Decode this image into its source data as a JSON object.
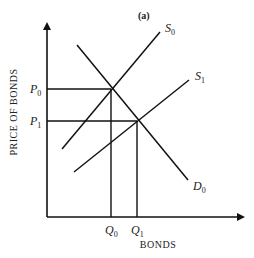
{
  "panel_label": "(a)",
  "axes": {
    "y_title": "PRICE OF BONDS",
    "x_title": "BONDS"
  },
  "curves": {
    "s0": {
      "base": "S",
      "sub": "0"
    },
    "s1": {
      "base": "S",
      "sub": "1"
    },
    "d0": {
      "base": "D",
      "sub": "0"
    }
  },
  "ticks": {
    "p0": {
      "base": "P",
      "sub": "0"
    },
    "p1": {
      "base": "P",
      "sub": "1"
    },
    "q0": {
      "base": "Q",
      "sub": "0"
    },
    "q1": {
      "base": "Q",
      "sub": "1"
    }
  },
  "colors": {
    "ink": "#111111",
    "background": "#ffffff"
  }
}
